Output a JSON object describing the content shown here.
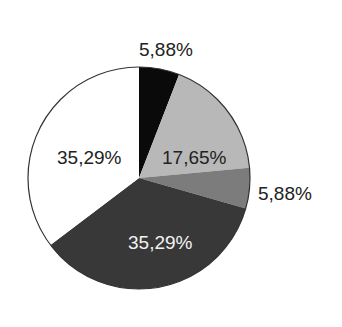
{
  "chart_data": {
    "type": "pie",
    "title": "",
    "start_angle_deg": 0,
    "direction": "clockwise",
    "slices": [
      {
        "label": "5,88%",
        "value": 5.88,
        "color": "#0a0a0a",
        "label_color": "#222222",
        "label_position": "outside"
      },
      {
        "label": "17,65%",
        "value": 17.65,
        "color": "#b8b8b8",
        "label_color": "#222222",
        "label_position": "inside"
      },
      {
        "label": "5,88%",
        "value": 5.88,
        "color": "#7c7c7c",
        "label_color": "#222222",
        "label_position": "outside"
      },
      {
        "label": "35,29%",
        "value": 35.29,
        "color": "#383838",
        "label_color": "#f2f2f2",
        "label_position": "inside"
      },
      {
        "label": "35,29%",
        "value": 35.29,
        "color": "#ffffff",
        "label_color": "#222222",
        "label_position": "inside"
      }
    ],
    "legend": "none",
    "edge_color": "#333333"
  }
}
